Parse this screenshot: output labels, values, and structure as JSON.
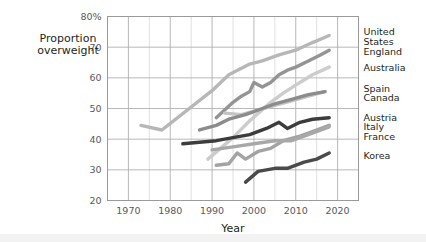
{
  "chart_data": {
    "type": "line",
    "title": "",
    "xlabel": "Year",
    "ylabel": "Proportion overweight",
    "ylabel_line1": "Proportion",
    "ylabel_line2": "overweight",
    "xlim": [
      1965,
      2025
    ],
    "ylim": [
      20,
      80
    ],
    "xticks": [
      1970,
      1980,
      1990,
      2000,
      2010,
      2020
    ],
    "xtick_labels": [
      "1970",
      "1980",
      "1990",
      "2000",
      "2010",
      "2020"
    ],
    "yticks": [
      20,
      30,
      40,
      50,
      60,
      70,
      80
    ],
    "ytick_labels": [
      "20",
      "30",
      "40",
      "50",
      "60",
      "70",
      "80%"
    ],
    "x_minor_step": 5,
    "grid": true,
    "legend_position": "right-inline-labels",
    "series": [
      {
        "name": "United States",
        "label": "United States",
        "label_lines": [
          "United",
          "States"
        ],
        "color": "#b7b7b7",
        "width": 3.4,
        "label_y": 73.5,
        "points": [
          [
            1973,
            44.5
          ],
          [
            1978,
            43.0
          ],
          [
            1990,
            55.8
          ],
          [
            1994,
            61.0
          ],
          [
            1999,
            64.5
          ],
          [
            2002,
            65.5
          ],
          [
            2006,
            67.5
          ],
          [
            2010,
            69.0
          ],
          [
            2014,
            71.5
          ],
          [
            2018,
            73.8
          ]
        ]
      },
      {
        "name": "England",
        "label": "England",
        "label_lines": [
          "England"
        ],
        "color": "#949494",
        "width": 3.4,
        "label_y": 68.5,
        "points": [
          [
            1991,
            47.0
          ],
          [
            1993,
            49.5
          ],
          [
            1995,
            52.0
          ],
          [
            1997,
            54.0
          ],
          [
            1999,
            55.5
          ],
          [
            2000,
            58.5
          ],
          [
            2002,
            57.0
          ],
          [
            2004,
            58.5
          ],
          [
            2006,
            61.0
          ],
          [
            2008,
            62.5
          ],
          [
            2010,
            63.5
          ],
          [
            2013,
            65.5
          ],
          [
            2016,
            67.5
          ],
          [
            2018,
            69.0
          ]
        ]
      },
      {
        "name": "Australia",
        "label": "Australia",
        "label_lines": [
          "Australia"
        ],
        "color": "#cccccc",
        "width": 3.4,
        "label_y": 63.5,
        "points": [
          [
            1989,
            33.5
          ],
          [
            1995,
            40.5
          ],
          [
            1999,
            46.0
          ],
          [
            2004,
            52.0
          ],
          [
            2007,
            55.0
          ],
          [
            2011,
            58.5
          ],
          [
            2014,
            61.0
          ],
          [
            2018,
            63.5
          ]
        ]
      },
      {
        "name": "Spain",
        "label": "Spain",
        "label_lines": [
          "Spain"
        ],
        "color": "#c4c4c4",
        "width": 3.4,
        "label_y": 56.5,
        "points": [
          [
            1993,
            48.5
          ],
          [
            1997,
            48.0
          ],
          [
            2001,
            49.5
          ],
          [
            2005,
            51.0
          ],
          [
            2009,
            52.5
          ],
          [
            2013,
            54.0
          ],
          [
            2017,
            55.5
          ]
        ]
      },
      {
        "name": "Canada",
        "label": "Canada",
        "label_lines": [
          "Canada"
        ],
        "color": "#8c8c8c",
        "width": 3.4,
        "label_y": 53.5,
        "points": [
          [
            1987,
            43.0
          ],
          [
            1991,
            44.5
          ],
          [
            1994,
            46.5
          ],
          [
            1998,
            48.0
          ],
          [
            2002,
            50.0
          ],
          [
            2005,
            51.5
          ],
          [
            2009,
            53.0
          ],
          [
            2013,
            54.5
          ],
          [
            2017,
            55.5
          ]
        ]
      },
      {
        "name": "Austria",
        "label": "Austria",
        "label_lines": [
          "Austria"
        ],
        "color": "#3c3c3c",
        "width": 3.4,
        "label_y": 47.0,
        "points": [
          [
            1983,
            38.5
          ],
          [
            1991,
            39.5
          ],
          [
            1995,
            40.5
          ],
          [
            1999,
            41.5
          ],
          [
            2003,
            43.5
          ],
          [
            2006,
            45.5
          ],
          [
            2008,
            43.5
          ],
          [
            2011,
            45.5
          ],
          [
            2014,
            46.5
          ],
          [
            2018,
            47.0
          ]
        ]
      },
      {
        "name": "Italy",
        "label": "Italy",
        "label_lines": [
          "Italy"
        ],
        "color": "#a3a3a3",
        "width": 3.4,
        "label_y": 44.0,
        "points": [
          [
            1991,
            31.5
          ],
          [
            1994,
            32.0
          ],
          [
            1996,
            35.5
          ],
          [
            1998,
            33.5
          ],
          [
            2001,
            36.0
          ],
          [
            2004,
            37.0
          ],
          [
            2007,
            39.5
          ],
          [
            2011,
            41.0
          ],
          [
            2014,
            42.5
          ],
          [
            2018,
            44.5
          ]
        ]
      },
      {
        "name": "France",
        "label": "France",
        "label_lines": [
          "France"
        ],
        "color": "#a8a8a8",
        "width": 3.4,
        "label_y": 41.0,
        "points": [
          [
            1990,
            36.5
          ],
          [
            1995,
            37.5
          ],
          [
            2000,
            38.5
          ],
          [
            2005,
            39.5
          ],
          [
            2009,
            39.5
          ],
          [
            2013,
            41.5
          ],
          [
            2018,
            44.0
          ]
        ]
      },
      {
        "name": "Korea",
        "label": "Korea",
        "label_lines": [
          "Korea"
        ],
        "color": "#4a4a4a",
        "width": 3.4,
        "label_y": 34.5,
        "points": [
          [
            1998,
            26.0
          ],
          [
            2001,
            29.5
          ],
          [
            2005,
            30.5
          ],
          [
            2008,
            30.5
          ],
          [
            2012,
            32.5
          ],
          [
            2015,
            33.5
          ],
          [
            2018,
            35.5
          ]
        ]
      }
    ]
  }
}
